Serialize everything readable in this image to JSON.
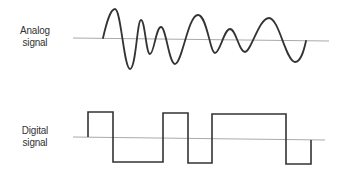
{
  "diagram": {
    "colors": {
      "background": "#ffffff",
      "baseline": "#aaaaaa",
      "signal": "#333333",
      "label": "#333333"
    },
    "analog": {
      "label_line1": "Analog",
      "label_line2": "signal",
      "baseline": {
        "x1": 73,
        "y1": 38,
        "x2": 329,
        "y2": 41
      },
      "wave_path": "M 103 38 C 106 25, 110 9, 115 9 C 121 9, 124 69, 130 69 C 136 69, 137 20, 141 20 C 145 20, 146 54, 150 54 C 154 54, 156 27, 161 27 C 166 27, 169 64, 175 64 C 182 64, 188 15, 198 15 C 207 15, 210 53, 215 53 C 220 53, 224 29, 230 29 C 236 29, 239 52, 245 52 C 251 52, 259 18, 269 18 C 279 18, 286 62, 295 62 C 301 62, 304 50, 306 41"
    },
    "digital": {
      "label_line1": "Digital",
      "label_line2": "signal",
      "baseline": {
        "x1": 73,
        "y1": 137,
        "x2": 325,
        "y2": 140
      },
      "wave_points": "88,137 88,112 113,112 113,162 163,162 163,113 188,113 188,163 212,163 212,114 286,114 286,164 311,164 311,140"
    }
  }
}
